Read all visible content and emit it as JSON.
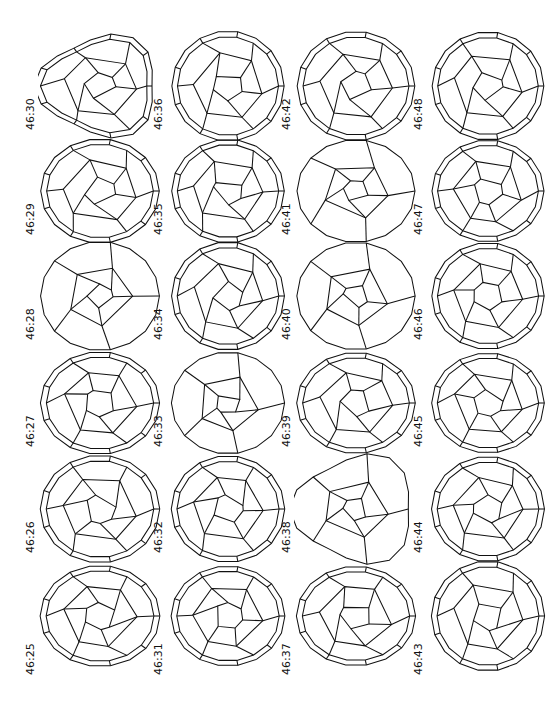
{
  "figure": {
    "orientation": "rotated-90",
    "columns": [
      {
        "items": [
          {
            "label": "46:30",
            "shape": "triangle-round"
          },
          {
            "label": "46:29",
            "shape": "round"
          },
          {
            "label": "46:28",
            "shape": "sparse"
          },
          {
            "label": "46:27",
            "shape": "round"
          },
          {
            "label": "46:26",
            "shape": "round"
          },
          {
            "label": "46:25",
            "shape": "round"
          }
        ]
      },
      {
        "items": [
          {
            "label": "46:36",
            "shape": "round"
          },
          {
            "label": "46:35",
            "shape": "round"
          },
          {
            "label": "46:34",
            "shape": "round"
          },
          {
            "label": "46:33",
            "shape": "sparse"
          },
          {
            "label": "46:32",
            "shape": "round"
          },
          {
            "label": "46:31",
            "shape": "round"
          }
        ]
      },
      {
        "items": [
          {
            "label": "46:42",
            "shape": "symmetric"
          },
          {
            "label": "46:41",
            "shape": "sparse"
          },
          {
            "label": "46:40",
            "shape": "sparse"
          },
          {
            "label": "46:39",
            "shape": "symmetric"
          },
          {
            "label": "46:38",
            "shape": "sparse-triangle"
          },
          {
            "label": "46:37",
            "shape": "round"
          }
        ]
      },
      {
        "items": [
          {
            "label": "46:48",
            "shape": "round"
          },
          {
            "label": "46:47",
            "shape": "round"
          },
          {
            "label": "46:46",
            "shape": "round"
          },
          {
            "label": "46:45",
            "shape": "round"
          },
          {
            "label": "46:44",
            "shape": "round"
          },
          {
            "label": "46:43",
            "shape": "round"
          }
        ]
      }
    ]
  }
}
